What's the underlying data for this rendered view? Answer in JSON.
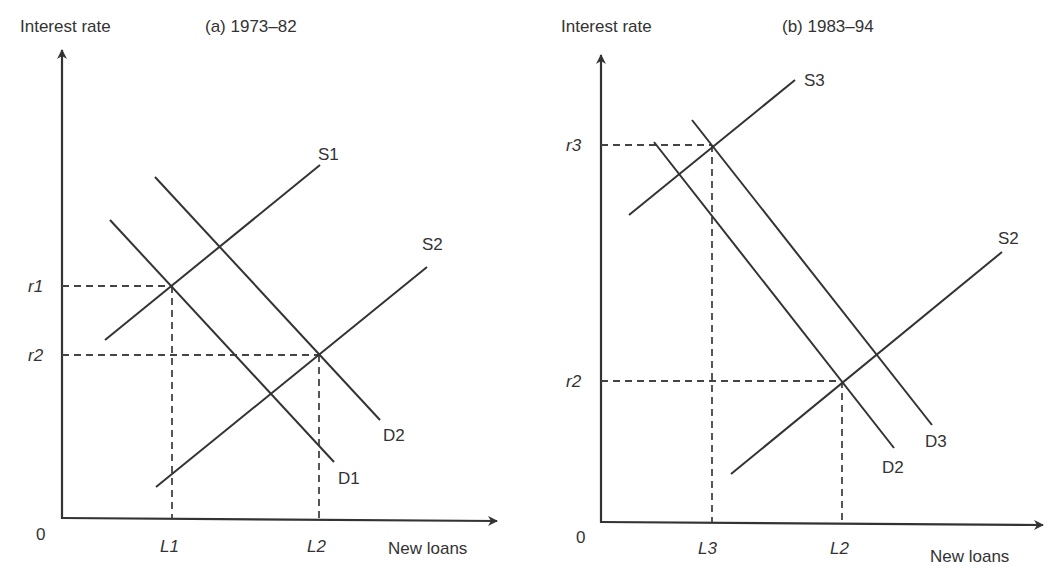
{
  "colors": {
    "line": "#333333",
    "dash": "#444444",
    "background": "#ffffff"
  },
  "panels": [
    {
      "id": "a",
      "title": "(a) 1973–82",
      "title_pos": [
        205,
        20
      ],
      "y_axis_label": "Interest rate",
      "y_axis_label_pos": [
        20,
        20
      ],
      "x_axis_label": "New loans",
      "x_axis_label_pos": [
        388,
        548
      ],
      "origin_label": "0",
      "origin_pos": [
        36,
        540
      ],
      "axis": {
        "x0": 62,
        "y0": 518,
        "ytop": 50,
        "xright": 497
      },
      "curves": [
        {
          "name": "S1",
          "x1": 105,
          "y1": 340,
          "x2": 320,
          "y2": 165,
          "label_pos": [
            318,
            160
          ]
        },
        {
          "name": "S2",
          "x1": 156,
          "y1": 487,
          "x2": 427,
          "y2": 267,
          "label_pos": [
            422,
            250
          ]
        },
        {
          "name": "D1",
          "x1": 110,
          "y1": 220,
          "x2": 334,
          "y2": 462,
          "label_pos": [
            338,
            484
          ]
        },
        {
          "name": "D2",
          "x1": 155,
          "y1": 177,
          "x2": 380,
          "y2": 420,
          "label_pos": [
            383,
            441
          ]
        }
      ],
      "guides": [
        {
          "level_label": "r1",
          "y": 286,
          "x": 172,
          "level_label_pos": [
            28,
            292
          ],
          "qty_label": "L1",
          "qty_label_pos": [
            160,
            552
          ]
        },
        {
          "level_label": "r2",
          "y": 355,
          "x": 319,
          "level_label_pos": [
            28,
            361
          ],
          "qty_label": "L2",
          "qty_label_pos": [
            307,
            552
          ]
        }
      ]
    },
    {
      "id": "b",
      "title": "(b) 1983–94",
      "title_pos": [
        782,
        20
      ],
      "y_axis_label": "Interest rate",
      "y_axis_label_pos": [
        561,
        20
      ],
      "x_axis_label": "New loans",
      "x_axis_label_pos": [
        930,
        556
      ],
      "origin_label": "0",
      "origin_pos": [
        576,
        543
      ],
      "axis": {
        "x0": 601,
        "y0": 522,
        "ytop": 55,
        "xright": 1043
      },
      "curves": [
        {
          "name": "S3",
          "x1": 629,
          "y1": 215,
          "x2": 795,
          "y2": 80,
          "label_pos": [
            804,
            86
          ]
        },
        {
          "name": "S2",
          "x1": 731,
          "y1": 474,
          "x2": 1002,
          "y2": 252,
          "label_pos": [
            998,
            244
          ]
        },
        {
          "name": "D2",
          "x1": 654,
          "y1": 142,
          "x2": 894,
          "y2": 448,
          "label_pos": [
            882,
            473
          ]
        },
        {
          "name": "D3",
          "x1": 692,
          "y1": 120,
          "x2": 932,
          "y2": 425,
          "label_pos": [
            925,
            447
          ]
        }
      ],
      "guides": [
        {
          "level_label": "r3",
          "y": 145,
          "x": 712,
          "level_label_pos": [
            566,
            151
          ],
          "qty_label": "L3",
          "qty_label_pos": [
            698,
            554
          ]
        },
        {
          "level_label": "r2",
          "y": 381,
          "x": 842,
          "level_label_pos": [
            566,
            387
          ],
          "qty_label": "L2",
          "qty_label_pos": [
            830,
            554
          ]
        }
      ]
    }
  ]
}
